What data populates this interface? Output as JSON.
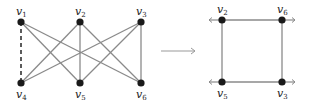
{
  "diagram": {
    "left_graph": {
      "nodes": [
        {
          "id": "v1",
          "label": "v",
          "sub": "1",
          "x": 21,
          "y": 22,
          "label_pos": "above"
        },
        {
          "id": "v2",
          "label": "v",
          "sub": "2",
          "x": 80,
          "y": 22,
          "label_pos": "above"
        },
        {
          "id": "v3",
          "label": "v",
          "sub": "3",
          "x": 141,
          "y": 22,
          "label_pos": "above"
        },
        {
          "id": "v4",
          "label": "v",
          "sub": "4",
          "x": 21,
          "y": 83,
          "label_pos": "below"
        },
        {
          "id": "v5",
          "label": "v",
          "sub": "5",
          "x": 80,
          "y": 83,
          "label_pos": "below"
        },
        {
          "id": "v6",
          "label": "v",
          "sub": "6",
          "x": 141,
          "y": 83,
          "label_pos": "below"
        }
      ],
      "edges": [
        {
          "from": "v1",
          "to": "v4",
          "style": "dashed"
        },
        {
          "from": "v1",
          "to": "v5",
          "style": "solid"
        },
        {
          "from": "v1",
          "to": "v6",
          "style": "solid"
        },
        {
          "from": "v2",
          "to": "v4",
          "style": "solid"
        },
        {
          "from": "v2",
          "to": "v5",
          "style": "solid"
        },
        {
          "from": "v2",
          "to": "v6",
          "style": "solid"
        },
        {
          "from": "v3",
          "to": "v4",
          "style": "solid"
        },
        {
          "from": "v3",
          "to": "v5",
          "style": "solid"
        },
        {
          "from": "v3",
          "to": "v6",
          "style": "solid"
        }
      ]
    },
    "arrow": {
      "x1": 161,
      "x2": 195,
      "y": 51
    },
    "right_graph": {
      "nodes": [
        {
          "id": "v2",
          "label": "v",
          "sub": "2",
          "x": 222,
          "y": 20,
          "label_pos": "above",
          "stub": "left"
        },
        {
          "id": "v6",
          "label": "v",
          "sub": "6",
          "x": 282,
          "y": 20,
          "label_pos": "above",
          "stub": "right"
        },
        {
          "id": "v5",
          "label": "v",
          "sub": "5",
          "x": 222,
          "y": 82,
          "label_pos": "below",
          "stub": "left"
        },
        {
          "id": "v3",
          "label": "v",
          "sub": "3",
          "x": 282,
          "y": 82,
          "label_pos": "below",
          "stub": "right"
        }
      ],
      "edges": [
        {
          "from": "v2",
          "to": "v6"
        },
        {
          "from": "v6",
          "to": "v3"
        },
        {
          "from": "v3",
          "to": "v5"
        },
        {
          "from": "v5",
          "to": "v2"
        }
      ]
    },
    "colors": {
      "edge": "#8a8a8a",
      "node": "#1a1a1a",
      "dashed": "#333333",
      "arrow": "#999999"
    }
  }
}
